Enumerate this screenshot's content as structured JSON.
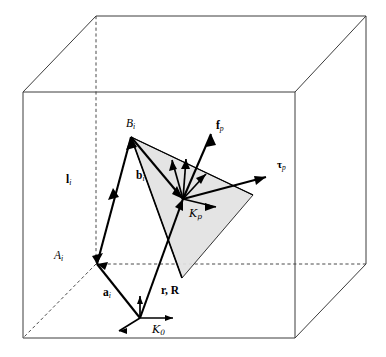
{
  "figure": {
    "background_color": "#ffffff",
    "line_color": "#3c3c3c",
    "platform_fill": "#e2e2e2",
    "vector_color": "#000000"
  },
  "labels": {
    "point_b": {
      "text": "B",
      "sub": "i",
      "x": 126,
      "y": 120
    },
    "point_a": {
      "text": "A",
      "sub": "i",
      "x": 56,
      "y": 252
    },
    "vector_l": {
      "text": "l",
      "sub": "i",
      "x": 67,
      "y": 175
    },
    "vector_b": {
      "text": "b",
      "sub": "i",
      "x": 137,
      "y": 172
    },
    "vector_a": {
      "text": "a",
      "sub": "i",
      "x": 104,
      "y": 288
    },
    "vector_r_R": {
      "text": "r, R",
      "x": 163,
      "y": 286
    },
    "force_f": {
      "text": "f",
      "sub": "p",
      "x": 217,
      "y": 122
    },
    "torque_tau": {
      "text": "τ",
      "sub": "p",
      "x": 278,
      "y": 160
    },
    "frame_p": {
      "text": "𝒜",
      "glyph": "K",
      "sub": "p",
      "x": 191,
      "y": 209
    },
    "frame_0": {
      "text": "K",
      "sub": "0",
      "x": 153,
      "y": 325
    }
  },
  "geometry": {
    "cube": {
      "front_top_left": [
        23,
        92
      ],
      "front_top_right": [
        295,
        92
      ],
      "front_bottom_left": [
        23,
        338
      ],
      "front_bottom_right": [
        295,
        338
      ],
      "back_top_left": [
        96,
        16
      ],
      "back_top_right": [
        366,
        16
      ],
      "back_bottom_left": [
        96,
        264
      ],
      "back_bottom_right": [
        366,
        264
      ]
    },
    "point_A": [
      97,
      264
    ],
    "point_B": [
      131,
      137
    ],
    "frame_p_origin": [
      183,
      199
    ],
    "frame_0_origin": [
      140,
      318
    ],
    "platform_vertices": [
      [
        131,
        137
      ],
      [
        253,
        195
      ],
      [
        182,
        278
      ]
    ]
  },
  "legend": {
    "description": "Wireframe workspace cube with cable vector l_i from winch point A_i to platform attachment B_i, platform pose vectors r and R, platform-fixed frame K_p, base frame K_0, and applied wrench f_p, tau_p."
  }
}
